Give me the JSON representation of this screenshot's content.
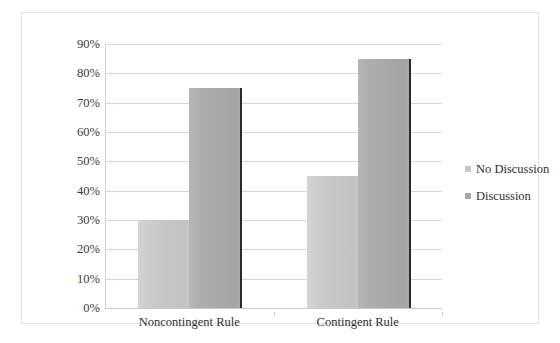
{
  "chart_data": {
    "type": "bar",
    "title": "",
    "subtitle": "",
    "xlabel": "",
    "ylabel": "",
    "categories": [
      "Noncontingent Rule",
      "Contingent Rule"
    ],
    "series": [
      {
        "name": "No Discussion",
        "values": [
          30,
          45
        ],
        "color": "#c6c6c6"
      },
      {
        "name": "Discussion",
        "values": [
          75,
          85
        ],
        "color": "#a8a8a8"
      }
    ],
    "ylim": [
      0,
      90
    ],
    "ytick_labels": [
      "90%",
      "80%",
      "70%",
      "60%",
      "50%",
      "40%",
      "30%",
      "20%",
      "10%",
      "0%"
    ],
    "ytick_values": [
      90,
      80,
      70,
      60,
      50,
      40,
      30,
      20,
      10,
      0
    ],
    "ytick_step": 10,
    "value_format": "percent",
    "grid": true,
    "grid_axis": "y",
    "legend_position": "right",
    "legend_entries": [
      "No Discussion",
      "Discussion"
    ],
    "plot_background": "#ffffff",
    "grid_color": "#d6d6d6",
    "border_color": "#e3e3e3"
  }
}
